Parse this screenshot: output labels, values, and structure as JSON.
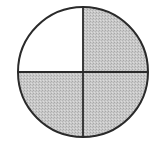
{
  "figure": {
    "total_parts": 4,
    "shaded_parts": 3,
    "unshaded_part": "top-left",
    "fraction_shaded": "3/4",
    "colors": {
      "shaded": "#c4c4c4",
      "unshaded": "#ffffff",
      "outline": "#2a2a2a"
    }
  }
}
